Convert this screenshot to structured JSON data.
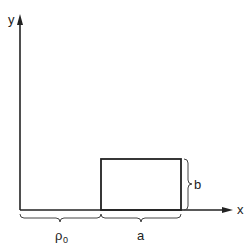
{
  "diagram": {
    "axes": {
      "x_label": "x",
      "y_label": "y"
    },
    "rectangle": {
      "width_label": "a",
      "height_label": "b"
    },
    "offset": {
      "label_main": "ρ",
      "label_sub": "0"
    },
    "colors": {
      "stroke": "#222222",
      "background": "#ffffff"
    }
  }
}
